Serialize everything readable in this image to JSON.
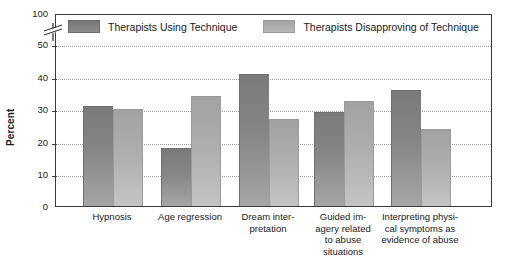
{
  "chart_data": {
    "type": "bar",
    "title": "",
    "xlabel": "",
    "ylabel": "Percent",
    "ylim": [
      0,
      100
    ],
    "yticks": [
      0,
      10,
      20,
      30,
      40,
      50,
      100
    ],
    "axis_break": true,
    "axis_break_between": [
      50,
      100
    ],
    "grid": true,
    "grid_axis": "y",
    "legend_position": "top-inside",
    "categories": [
      "Hypnosis",
      "Age regression",
      "Dream inter-\npretation",
      "Guided im-\nagery related\nto abuse\nsituations",
      "Interpreting physi-\ncal symptoms as\nevidence of abuse"
    ],
    "series": [
      {
        "name": "Therapists Using Technique",
        "color": "#7d7d7d",
        "values": [
          31,
          18,
          41,
          29,
          36
        ]
      },
      {
        "name": "Therapists Disapproving of Technique",
        "color": "#a8a8a8",
        "values": [
          30,
          34,
          27,
          32.5,
          24
        ]
      }
    ]
  },
  "axis": {
    "y_title": "Percent",
    "ticks": [
      {
        "label": "100",
        "value": 100
      },
      {
        "label": "50",
        "value": 50
      },
      {
        "label": "40",
        "value": 40
      },
      {
        "label": "30",
        "value": 30
      },
      {
        "label": "20",
        "value": 20
      },
      {
        "label": "10",
        "value": 10
      },
      {
        "label": "0",
        "value": 0
      }
    ]
  },
  "legend": {
    "items": [
      {
        "label": "Therapists Using Technique",
        "swatch": "dark"
      },
      {
        "label": "Therapists Disapproving of Technique",
        "swatch": "light"
      }
    ]
  },
  "categories_display": [
    {
      "lines": [
        "Hypnosis"
      ]
    },
    {
      "lines": [
        "Age regression"
      ]
    },
    {
      "lines": [
        "Dream inter-",
        "pretation"
      ]
    },
    {
      "lines": [
        "Guided im-",
        "agery related",
        "to abuse",
        "situations"
      ]
    },
    {
      "lines": [
        "Interpreting physi-",
        "cal symptoms as",
        "evidence of abuse"
      ]
    }
  ]
}
